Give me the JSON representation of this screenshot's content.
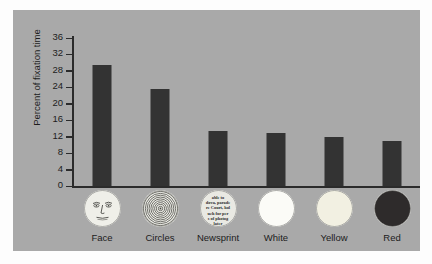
{
  "chart_data": {
    "type": "bar",
    "title": "",
    "xlabel": "",
    "ylabel": "Percent of fixation time",
    "ylim": [
      0,
      36
    ],
    "yticks": [
      0,
      4,
      8,
      12,
      16,
      20,
      24,
      28,
      32,
      36
    ],
    "grid": false,
    "legend": null,
    "categories": [
      "Face",
      "Circles",
      "Newsprint",
      "White",
      "Yellow",
      "Red"
    ],
    "values": [
      29.5,
      23.5,
      13.5,
      13,
      12,
      11
    ],
    "bar_color": "#333333",
    "panel_color": "#a9a9a9",
    "background_color": "#fdfdfd"
  },
  "axis": {
    "y_label": "Percent of fixation time",
    "y_ticks": [
      "0",
      "4",
      "8",
      "12",
      "16",
      "20",
      "24",
      "28",
      "32",
      "36"
    ]
  },
  "categories": [
    {
      "label": "Face",
      "value": 29.5,
      "icon": "face-circle-icon",
      "icon_fill": "#efefe9"
    },
    {
      "label": "Circles",
      "value": 23.5,
      "icon": "concentric-circles-icon",
      "icon_fill": "#efefe9"
    },
    {
      "label": "Newsprint",
      "value": 13.5,
      "icon": "newsprint-circle-icon",
      "icon_fill": "#e9e9e3",
      "newsprint_lines": [
        "able to",
        "dova, parade",
        "re Court, hol",
        "uch for per",
        "s of photog",
        "later"
      ]
    },
    {
      "label": "White",
      "value": 13,
      "icon": "white-circle-icon",
      "icon_fill": "#fbfbf7"
    },
    {
      "label": "Yellow",
      "value": 12,
      "icon": "yellow-circle-icon",
      "icon_fill": "#f2f0e2"
    },
    {
      "label": "Red",
      "value": 11,
      "icon": "red-circle-icon",
      "icon_fill": "#2e2b2b"
    }
  ]
}
